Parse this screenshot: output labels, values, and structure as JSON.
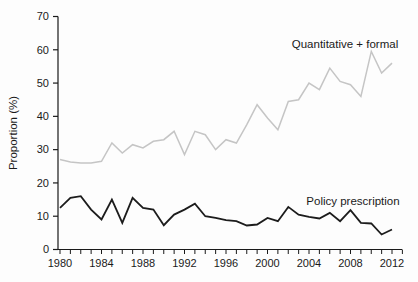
{
  "chart_data": {
    "type": "line",
    "title": "",
    "xlabel": "",
    "ylabel": "Proportion (%)",
    "grid": false,
    "legend_position": "inline-annotations",
    "ylim": [
      0,
      70
    ],
    "y_tick_step": 10,
    "y_ticks": [
      0,
      10,
      20,
      30,
      40,
      50,
      60,
      70
    ],
    "x_axis_range": [
      1980,
      2013
    ],
    "x_labeled_ticks": [
      1980,
      1984,
      1988,
      1992,
      1996,
      2000,
      2004,
      2008,
      2012
    ],
    "x": [
      1980,
      1981,
      1982,
      1983,
      1984,
      1985,
      1986,
      1987,
      1988,
      1989,
      1990,
      1991,
      1992,
      1993,
      1994,
      1995,
      1996,
      1997,
      1998,
      1999,
      2000,
      2001,
      2002,
      2003,
      2004,
      2005,
      2006,
      2007,
      2008,
      2009,
      2010,
      2011,
      2012
    ],
    "series": [
      {
        "name": "Quantitative + formal",
        "color": "#c5c5c5",
        "stroke_width": 1.5,
        "label_x": 345,
        "label_y": 48,
        "values": [
          27,
          26.3,
          26,
          26,
          26.5,
          32,
          29,
          31.5,
          30.5,
          32.5,
          33,
          35.5,
          28.5,
          35.5,
          34.5,
          30,
          33,
          32,
          37.5,
          43.5,
          39.5,
          36,
          44.5,
          45,
          50,
          48,
          54.5,
          50.5,
          49.5,
          46,
          59.5,
          53,
          56
        ]
      },
      {
        "name": "Policy prescription",
        "color": "#1c1c1c",
        "stroke_width": 1.8,
        "label_x": 353,
        "label_y": 205,
        "values": [
          12.5,
          15.5,
          16,
          12,
          9,
          15,
          8,
          15.5,
          12.5,
          12,
          7.3,
          10.5,
          12,
          13.8,
          10,
          9.5,
          8.8,
          8.5,
          7.2,
          7.5,
          9.5,
          8.5,
          12.8,
          10.5,
          9.8,
          9.3,
          11,
          8.5,
          11.8,
          8,
          7.8,
          4.5,
          6
        ]
      }
    ],
    "axis_color": "#1a1a1a",
    "plot_left_px": 58,
    "plot_right_px": 402,
    "plot_top_px": 16.5,
    "plot_bottom_px": 249.5,
    "x_first_year_px": 60,
    "px_per_year": 10.375
  }
}
